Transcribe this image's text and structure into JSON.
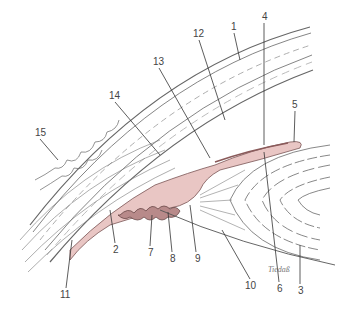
{
  "diagram": {
    "type": "anatomical illustration",
    "colors": {
      "tissue_pink": "#e9c6c4",
      "tissue_dark": "#b88a8a",
      "line": "#555555",
      "label": "#444444",
      "background": "#ffffff"
    },
    "labels": [
      {
        "id": "1",
        "text": "1",
        "x": 231,
        "y": 30
      },
      {
        "id": "2",
        "text": "2",
        "x": 113,
        "y": 253
      },
      {
        "id": "3",
        "text": "3",
        "x": 298,
        "y": 294
      },
      {
        "id": "4",
        "text": "4",
        "x": 262,
        "y": 20
      },
      {
        "id": "5",
        "text": "5",
        "x": 292,
        "y": 108
      },
      {
        "id": "6",
        "text": "6",
        "x": 277,
        "y": 292
      },
      {
        "id": "7",
        "text": "7",
        "x": 148,
        "y": 256
      },
      {
        "id": "8",
        "text": "8",
        "x": 170,
        "y": 262
      },
      {
        "id": "9",
        "text": "9",
        "x": 195,
        "y": 262
      },
      {
        "id": "10",
        "text": "10",
        "x": 248,
        "y": 289
      },
      {
        "id": "11",
        "text": "11",
        "x": 63,
        "y": 298
      },
      {
        "id": "12",
        "text": "12",
        "x": 196,
        "y": 37
      },
      {
        "id": "13",
        "text": "13",
        "x": 156,
        "y": 65
      },
      {
        "id": "14",
        "text": "14",
        "x": 112,
        "y": 99
      },
      {
        "id": "15",
        "text": "15",
        "x": 38,
        "y": 136
      }
    ],
    "signature": "Tiedaß"
  }
}
